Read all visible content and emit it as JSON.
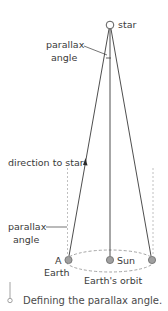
{
  "diagram": {
    "labels": {
      "star": "star",
      "top_angle_line1": "parallax",
      "top_angle_line2": "angle",
      "direction": "direction to star",
      "bottom_angle_line1": "parallax",
      "bottom_angle_line2": "angle",
      "earth_position": "A",
      "earth": "Earth",
      "sun": "Sun",
      "orbit": "Earth's orbit"
    },
    "colors": {
      "line": "#3a3a3a",
      "dashed": "#a8a8a8",
      "body_fill": "#a0a0a0",
      "body_stroke": "#6a6a6a",
      "caption_accent": "#8a8a8a"
    }
  },
  "caption": {
    "text": "Defining the parallax angle."
  }
}
